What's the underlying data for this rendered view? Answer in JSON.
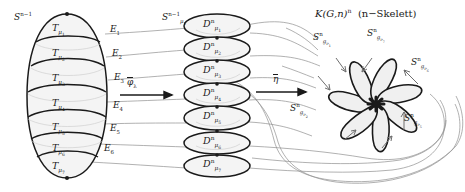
{
  "left_region": {
    "sphere_label": {
      "base": "S",
      "sup": "n−1"
    },
    "cells": [
      {
        "base": "T",
        "sub": "μ",
        "subsub": "1"
      },
      {
        "base": "T",
        "sub": "μ",
        "subsub": "2"
      },
      {
        "base": "T",
        "sub": "μ",
        "subsub": "3"
      },
      {
        "base": "T",
        "sub": "μ",
        "subsub": "4"
      },
      {
        "base": "T",
        "sub": "μ",
        "subsub": "5"
      },
      {
        "base": "T",
        "sub": "μ",
        "subsub": "6"
      },
      {
        "base": "T",
        "sub": "μ",
        "subsub": "7"
      }
    ],
    "edges": [
      {
        "base": "E",
        "sub": "1"
      },
      {
        "base": "E",
        "sub": "2"
      },
      {
        "base": "E",
        "sub": "3"
      },
      {
        "base": "E",
        "sub": "4"
      },
      {
        "base": "E",
        "sub": "5"
      },
      {
        "base": "E",
        "sub": "6"
      }
    ]
  },
  "arrow1": {
    "base": "φ",
    "sub": "λ",
    "overline": true
  },
  "arrow2": {
    "base": "η",
    "overline": true
  },
  "middle_region": {
    "boundary_label": {
      "base": "S",
      "sup": "n−1",
      "sub": "μ",
      "subsub": "1"
    },
    "disks": [
      {
        "base": "D",
        "sup": "n",
        "sub": "μ",
        "subsub": "1"
      },
      {
        "base": "D",
        "sup": "n",
        "sub": "μ",
        "subsub": "2"
      },
      {
        "base": "D",
        "sup": "n",
        "sub": "μ",
        "subsub": "3"
      },
      {
        "base": "D",
        "sup": "n",
        "sub": "μ",
        "subsub": "4"
      },
      {
        "base": "D",
        "sup": "n",
        "sub": "μ",
        "subsub": "5"
      },
      {
        "base": "D",
        "sup": "n",
        "sub": "μ",
        "subsub": "6"
      },
      {
        "base": "D",
        "sup": "n",
        "sub": "μ",
        "subsub": "7"
      }
    ]
  },
  "right_region": {
    "title": {
      "base": "K(G,n)",
      "sup": "n",
      "paren": "(n−Skelett)"
    },
    "petals": [
      {
        "base": "S",
        "sup": "n",
        "sub": "g",
        "subsub": "ν",
        "subsubsub": "1"
      },
      {
        "base": "S",
        "sup": "n",
        "sub": "g",
        "subsub": "ν",
        "subsubsub": "2"
      },
      {
        "base": "S",
        "sup": "n",
        "sub": "g",
        "subsub": "ν",
        "subsubsub": "5"
      },
      {
        "base": "S",
        "sup": "n",
        "sub": "g",
        "subsub": "ν",
        "subsubsub": "6"
      },
      {
        "base": "S",
        "sup": "n",
        "sub": "g",
        "subsub": "ν",
        "subsubsub": "7"
      }
    ]
  },
  "colors": {
    "ink": "#1a1a1a",
    "thin_line": "#8a8a8a",
    "fill": "#f2f2f2",
    "background": "#ffffff"
  }
}
